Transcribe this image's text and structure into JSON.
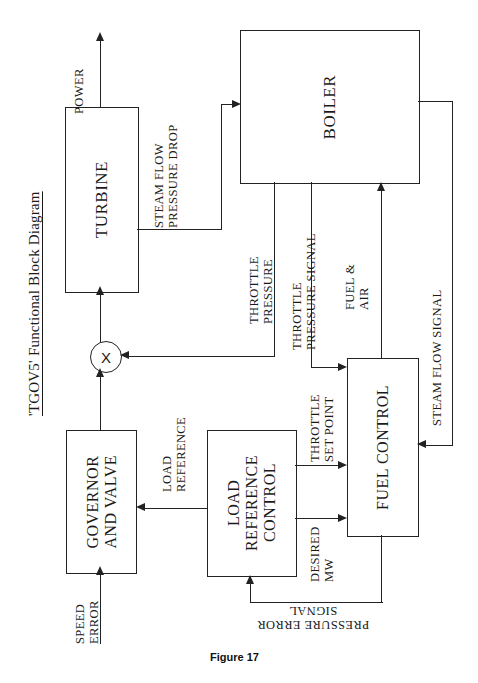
{
  "figure": {
    "title": "'TGOV5' Functional Block Diagram",
    "caption": "Figure 17",
    "orientation": "rotated-90-ccw"
  },
  "blocks": [
    {
      "id": "turbine",
      "label": "TURBINE"
    },
    {
      "id": "boiler",
      "label": "BOILER"
    },
    {
      "id": "governor",
      "label": "GOVERNOR\nAND VALVE"
    },
    {
      "id": "loadref",
      "label": "LOAD\nREFERENCE\nCONTROL"
    },
    {
      "id": "fuelctl",
      "label": "FUEL CONTROL"
    }
  ],
  "multiplier": {
    "symbol": "X"
  },
  "signals": [
    {
      "id": "power",
      "label": "POWER"
    },
    {
      "id": "steam-flow-drop",
      "label": "STEAM FLOW\nPRESSURE DROP"
    },
    {
      "id": "throttle-pressure",
      "label": "THROTTLE\nPRESSURE"
    },
    {
      "id": "throttle-press-sig",
      "label": "THROTTLE\nPRESSURE SIGNAL"
    },
    {
      "id": "fuel-air",
      "label": "FUEL &\nAIR"
    },
    {
      "id": "steam-flow-signal",
      "label": "STEAM FLOW SIGNAL"
    },
    {
      "id": "throttle-setpoint",
      "label": "THROTTLE\nSET POINT"
    },
    {
      "id": "desired-mw",
      "label": "DESIRED\nMW"
    },
    {
      "id": "load-reference",
      "label": "LOAD\nREFERENCE"
    },
    {
      "id": "speed-error",
      "label": "SPEED\nERROR"
    },
    {
      "id": "pressure-error-sig",
      "label": "PRESSURE ERROR\nSIGNAL"
    }
  ],
  "colors": {
    "ink": "#222222",
    "background": "#ffffff"
  }
}
